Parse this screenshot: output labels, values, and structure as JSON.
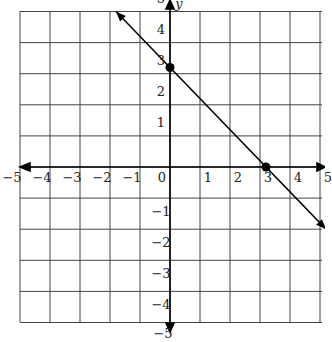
{
  "chart_data": {
    "type": "line",
    "title": "",
    "xlabel": "",
    "ylabel": "y",
    "xlim": [
      -5,
      5
    ],
    "ylim": [
      -5,
      5
    ],
    "grid": true,
    "x_ticks": [
      "−5",
      "−4",
      "−3",
      "−2",
      "−1",
      "0",
      "1",
      "2",
      "3",
      "4",
      "5"
    ],
    "y_ticks": [
      "5",
      "4",
      "3",
      "2",
      "1",
      "−1",
      "−2",
      "−3",
      "−4",
      "−5"
    ],
    "series": [
      {
        "name": "line",
        "x": [
          -1.8,
          5.2
        ],
        "y": [
          5.0,
          -2.0
        ],
        "arrows": "both"
      }
    ],
    "points": [
      {
        "x": 0,
        "y": 3.2
      },
      {
        "x": 3.2,
        "y": 0
      }
    ]
  }
}
